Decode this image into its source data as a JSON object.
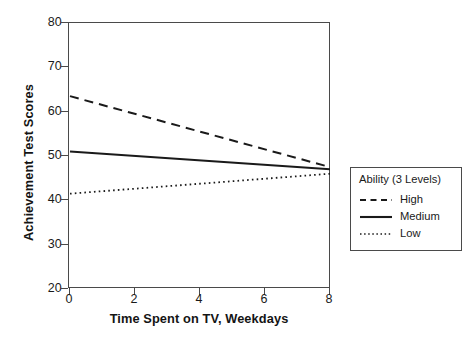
{
  "chart_data": {
    "type": "line",
    "title": "",
    "xlabel": "Time Spent on TV, Weekdays",
    "ylabel": "Achievement Test Scores",
    "xlim": [
      0,
      8
    ],
    "ylim": [
      20,
      80
    ],
    "xticks": [
      0,
      2,
      4,
      6,
      8
    ],
    "yticks": [
      20,
      30,
      40,
      50,
      60,
      70,
      80
    ],
    "xtick_labels": [
      "0",
      "2",
      "4",
      "6",
      "8"
    ],
    "ytick_labels": [
      "20",
      "30",
      "40",
      "50",
      "60",
      "70",
      "80"
    ],
    "grid": false,
    "legend_position": "right-outside",
    "legend_title": "Ability (3 Levels)",
    "x": [
      0,
      8
    ],
    "series": [
      {
        "name": "High",
        "style": "dashed",
        "color": "#1a1a1a",
        "values": [
          63.5,
          47.5
        ]
      },
      {
        "name": "Medium",
        "style": "solid",
        "color": "#1a1a1a",
        "values": [
          51.0,
          47.0
        ]
      },
      {
        "name": "Low",
        "style": "dotted",
        "color": "#1a1a1a",
        "values": [
          41.5,
          46.0
        ]
      }
    ]
  },
  "axes": {
    "y_title": "Achievement Test Scores",
    "x_title": "Time Spent on TV, Weekdays"
  },
  "legend": {
    "title": "Ability (3 Levels)",
    "items": [
      {
        "label": "High"
      },
      {
        "label": "Medium"
      },
      {
        "label": "Low"
      }
    ]
  },
  "caption": {
    "text": ""
  }
}
